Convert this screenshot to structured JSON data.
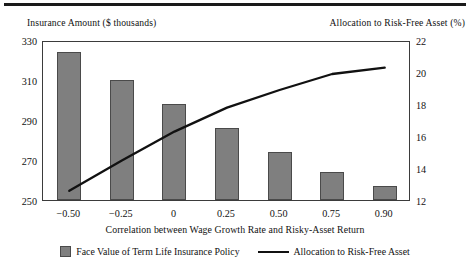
{
  "figure": {
    "left_axis_title": "Insurance Amount ($ thousands)",
    "right_axis_title": "Allocation to Risk-Free Asset (%)",
    "x_axis_title": "Correlation between Wage Growth Rate and Risky-Asset Return",
    "colors": {
      "bar_fill": "#7f7f7f",
      "bar_edge": "#4a4a4a",
      "line": "#111111",
      "frame": "#3b3b3b",
      "text": "#111111"
    }
  },
  "legend": {
    "entries": [
      {
        "label": "Face Value of Term Life Insurance Policy",
        "marker": "bar-swatch"
      },
      {
        "label": "Allocation to Risk-Free Asset",
        "marker": "line-swatch"
      }
    ]
  },
  "axes": {
    "left_ticks": [
      "330",
      "310",
      "290",
      "270",
      "250"
    ],
    "right_ticks": [
      "22",
      "20",
      "18",
      "16",
      "14",
      "12"
    ],
    "x_ticks": [
      "−0.50",
      "−0.25",
      "0",
      "0.25",
      "0.50",
      "0.75",
      "0.90"
    ]
  },
  "chart_data": {
    "type": "bar",
    "title": "",
    "subtitle": "",
    "xlabel": "Correlation between Wage Growth Rate and Risky-Asset Return",
    "ylabel": "Insurance Amount ($ thousands)",
    "y2label": "Allocation to Risk-Free Asset (%)",
    "categories": [
      "-0.50",
      "-0.25",
      "0",
      "0.25",
      "0.50",
      "0.75",
      "0.90"
    ],
    "ylim": [
      250,
      330
    ],
    "y2lim": [
      12,
      22
    ],
    "yticks": [
      250,
      270,
      290,
      310,
      330
    ],
    "y2ticks": [
      12,
      14,
      16,
      18,
      20,
      22
    ],
    "grid": false,
    "legend_position": "bottom",
    "series": [
      {
        "name": "Face Value of Term Life Insurance Policy",
        "type": "bar",
        "axis": "left",
        "color": "#7f7f7f",
        "values": [
          324,
          310,
          298,
          286,
          274,
          264,
          257
        ]
      },
      {
        "name": "Allocation to Risk-Free Asset",
        "type": "line",
        "axis": "right",
        "color": "#111111",
        "values": [
          12.7,
          14.6,
          16.4,
          17.9,
          19.0,
          20.0,
          20.4
        ]
      }
    ]
  }
}
